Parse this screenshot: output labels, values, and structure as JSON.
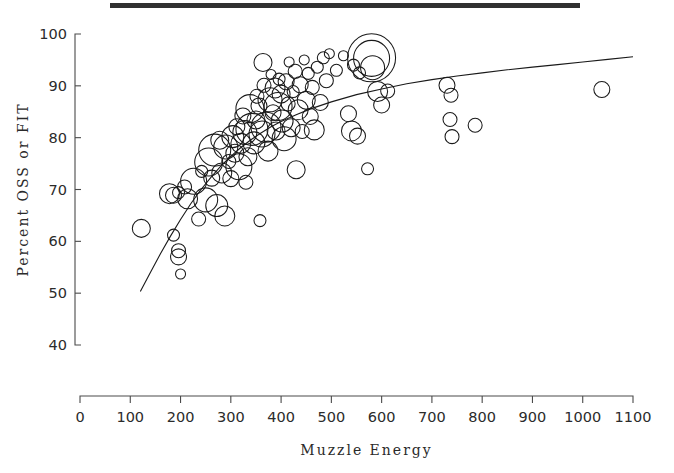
{
  "figure": {
    "top_rule": true,
    "background": "#ffffff",
    "ink_color": "#1a1a1a"
  },
  "chart_data": {
    "type": "scatter",
    "title": "",
    "subtitle": "",
    "xlabel": "Muzzle  Energy",
    "ylabel": "Percent OSS or FIT",
    "xlim": [
      0,
      1100
    ],
    "ylim": [
      40,
      100
    ],
    "xticks": [
      0,
      100,
      200,
      300,
      400,
      500,
      600,
      700,
      800,
      900,
      1000,
      1100
    ],
    "xticklabels": [
      "0",
      "100",
      "200",
      "300",
      "400",
      "500",
      "600",
      "700",
      "800",
      "900",
      "1000",
      "1100"
    ],
    "yticks": [
      40,
      50,
      60,
      70,
      80,
      90,
      100
    ],
    "yticklabels": [
      "40",
      "50",
      "60",
      "70",
      "80",
      "90",
      "100"
    ],
    "grid": false,
    "legend": false,
    "marker": "open-circle",
    "size_encoding": "bubble radius proportional to sample weight",
    "annotations": [],
    "fit_curve": {
      "name": "logistic fit",
      "x": [
        120,
        140,
        160,
        180,
        200,
        220,
        240,
        260,
        280,
        300,
        320,
        340,
        360,
        380,
        400,
        430,
        460,
        500,
        550,
        600,
        650,
        700,
        750,
        800,
        850,
        900,
        950,
        1000,
        1050,
        1100
      ],
      "y": [
        50.3,
        54.0,
        57.6,
        61.0,
        64.2,
        67.2,
        69.9,
        72.3,
        74.5,
        76.4,
        78.1,
        79.6,
        80.9,
        82.1,
        83.1,
        84.4,
        85.6,
        86.9,
        88.3,
        89.4,
        90.4,
        91.2,
        91.9,
        92.5,
        93.1,
        93.6,
        94.1,
        94.6,
        95.1,
        95.6
      ]
    },
    "points": [
      {
        "x": 122,
        "y": 62.5,
        "r": 9
      },
      {
        "x": 186,
        "y": 61.2,
        "r": 6
      },
      {
        "x": 196,
        "y": 58.2,
        "r": 7
      },
      {
        "x": 196,
        "y": 57.0,
        "r": 8
      },
      {
        "x": 200,
        "y": 53.7,
        "r": 5
      },
      {
        "x": 178,
        "y": 69.2,
        "r": 10
      },
      {
        "x": 186,
        "y": 68.9,
        "r": 8
      },
      {
        "x": 196,
        "y": 69.4,
        "r": 6
      },
      {
        "x": 208,
        "y": 70.5,
        "r": 7
      },
      {
        "x": 214,
        "y": 68.2,
        "r": 10
      },
      {
        "x": 226,
        "y": 71.6,
        "r": 13
      },
      {
        "x": 236,
        "y": 64.3,
        "r": 7
      },
      {
        "x": 242,
        "y": 73.5,
        "r": 6
      },
      {
        "x": 250,
        "y": 68.0,
        "r": 12
      },
      {
        "x": 256,
        "y": 75.3,
        "r": 14
      },
      {
        "x": 262,
        "y": 72.2,
        "r": 8
      },
      {
        "x": 268,
        "y": 77.6,
        "r": 16
      },
      {
        "x": 272,
        "y": 66.9,
        "r": 11
      },
      {
        "x": 278,
        "y": 79.5,
        "r": 9
      },
      {
        "x": 282,
        "y": 73.2,
        "r": 10
      },
      {
        "x": 288,
        "y": 64.9,
        "r": 10
      },
      {
        "x": 290,
        "y": 78.2,
        "r": 12
      },
      {
        "x": 296,
        "y": 75.4,
        "r": 7
      },
      {
        "x": 300,
        "y": 72.1,
        "r": 8
      },
      {
        "x": 304,
        "y": 80.2,
        "r": 11
      },
      {
        "x": 308,
        "y": 77.0,
        "r": 9
      },
      {
        "x": 312,
        "y": 82.1,
        "r": 8
      },
      {
        "x": 316,
        "y": 74.4,
        "r": 13
      },
      {
        "x": 320,
        "y": 78.9,
        "r": 10
      },
      {
        "x": 324,
        "y": 84.2,
        "r": 8
      },
      {
        "x": 328,
        "y": 81.0,
        "r": 12
      },
      {
        "x": 330,
        "y": 71.4,
        "r": 7
      },
      {
        "x": 334,
        "y": 76.3,
        "r": 9
      },
      {
        "x": 338,
        "y": 85.6,
        "r": 14
      },
      {
        "x": 342,
        "y": 81.6,
        "r": 16
      },
      {
        "x": 346,
        "y": 79.0,
        "r": 11
      },
      {
        "x": 350,
        "y": 83.4,
        "r": 9
      },
      {
        "x": 352,
        "y": 88.0,
        "r": 7
      },
      {
        "x": 356,
        "y": 86.1,
        "r": 8
      },
      {
        "x": 358,
        "y": 64.0,
        "r": 6
      },
      {
        "x": 362,
        "y": 80.7,
        "r": 13
      },
      {
        "x": 364,
        "y": 94.5,
        "r": 9
      },
      {
        "x": 366,
        "y": 90.1,
        "r": 7
      },
      {
        "x": 370,
        "y": 82.0,
        "r": 15
      },
      {
        "x": 374,
        "y": 77.4,
        "r": 10
      },
      {
        "x": 378,
        "y": 87.3,
        "r": 12
      },
      {
        "x": 380,
        "y": 92.2,
        "r": 5
      },
      {
        "x": 384,
        "y": 84.8,
        "r": 8
      },
      {
        "x": 388,
        "y": 89.6,
        "r": 10
      },
      {
        "x": 390,
        "y": 81.3,
        "r": 9
      },
      {
        "x": 394,
        "y": 86.0,
        "r": 14
      },
      {
        "x": 396,
        "y": 91.3,
        "r": 6
      },
      {
        "x": 400,
        "y": 88.4,
        "r": 9
      },
      {
        "x": 402,
        "y": 83.2,
        "r": 11
      },
      {
        "x": 406,
        "y": 79.8,
        "r": 12
      },
      {
        "x": 410,
        "y": 90.8,
        "r": 8
      },
      {
        "x": 414,
        "y": 86.5,
        "r": 7
      },
      {
        "x": 416,
        "y": 94.6,
        "r": 5
      },
      {
        "x": 420,
        "y": 81.9,
        "r": 9
      },
      {
        "x": 424,
        "y": 88.9,
        "r": 6
      },
      {
        "x": 428,
        "y": 92.8,
        "r": 7
      },
      {
        "x": 430,
        "y": 73.8,
        "r": 9
      },
      {
        "x": 434,
        "y": 85.4,
        "r": 10
      },
      {
        "x": 438,
        "y": 90.2,
        "r": 8
      },
      {
        "x": 442,
        "y": 81.2,
        "r": 7
      },
      {
        "x": 446,
        "y": 95.0,
        "r": 5
      },
      {
        "x": 450,
        "y": 87.2,
        "r": 9
      },
      {
        "x": 454,
        "y": 92.4,
        "r": 6
      },
      {
        "x": 458,
        "y": 84.1,
        "r": 8
      },
      {
        "x": 462,
        "y": 89.7,
        "r": 7
      },
      {
        "x": 466,
        "y": 81.5,
        "r": 10
      },
      {
        "x": 472,
        "y": 93.6,
        "r": 6
      },
      {
        "x": 478,
        "y": 86.8,
        "r": 8
      },
      {
        "x": 484,
        "y": 95.4,
        "r": 6
      },
      {
        "x": 490,
        "y": 91.0,
        "r": 7
      },
      {
        "x": 496,
        "y": 96.2,
        "r": 5
      },
      {
        "x": 510,
        "y": 93.0,
        "r": 6
      },
      {
        "x": 524,
        "y": 95.8,
        "r": 5
      },
      {
        "x": 534,
        "y": 84.6,
        "r": 8
      },
      {
        "x": 540,
        "y": 81.3,
        "r": 10
      },
      {
        "x": 544,
        "y": 94.0,
        "r": 6
      },
      {
        "x": 552,
        "y": 80.3,
        "r": 8
      },
      {
        "x": 556,
        "y": 92.5,
        "r": 6
      },
      {
        "x": 572,
        "y": 74.0,
        "r": 6
      },
      {
        "x": 580,
        "y": 95.4,
        "r": 24
      },
      {
        "x": 580,
        "y": 95.3,
        "r": 18
      },
      {
        "x": 582,
        "y": 93.5,
        "r": 12
      },
      {
        "x": 592,
        "y": 88.9,
        "r": 10
      },
      {
        "x": 600,
        "y": 86.3,
        "r": 8
      },
      {
        "x": 612,
        "y": 89.0,
        "r": 7
      },
      {
        "x": 730,
        "y": 90.1,
        "r": 8
      },
      {
        "x": 738,
        "y": 88.2,
        "r": 7
      },
      {
        "x": 736,
        "y": 83.5,
        "r": 7
      },
      {
        "x": 740,
        "y": 80.2,
        "r": 7
      },
      {
        "x": 786,
        "y": 82.4,
        "r": 7
      },
      {
        "x": 1038,
        "y": 89.3,
        "r": 8
      }
    ]
  }
}
